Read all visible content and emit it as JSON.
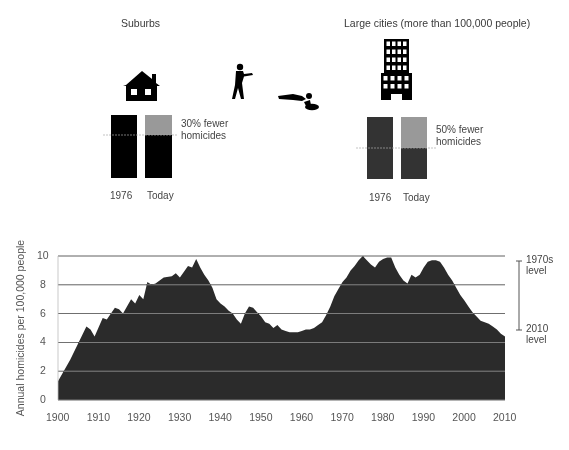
{
  "suburbs": {
    "title": "Suburbs",
    "icon": "house-icon",
    "bar_1976_label": "1976",
    "bar_today_label": "Today",
    "annotation_line1": "30% fewer",
    "annotation_line2": "homicides",
    "bar_color": "#000000",
    "reduction_color": "#999999",
    "reduction_pct": 30
  },
  "cities": {
    "title": "Large cities (more than 100,000 people)",
    "icon": "office-building-icon",
    "bar_1976_label": "1976",
    "bar_today_label": "Today",
    "annotation_line1": "50% fewer",
    "annotation_line2": "homicides",
    "bar_color": "#333333",
    "reduction_color": "#999999",
    "reduction_pct": 50
  },
  "pictograms": [
    "gunman-icon",
    "victim-lying-icon"
  ],
  "right_annotation": {
    "top_line1": "1970s",
    "top_line2": "level",
    "bottom_line1": "2010",
    "bottom_line2": "level"
  },
  "chart_data": {
    "type": "area",
    "title": "",
    "xlabel": "",
    "ylabel": "Annual homicides per 100,000 people",
    "xlim": [
      1900,
      2010
    ],
    "ylim": [
      0,
      10
    ],
    "grid": true,
    "fill_color": "#2b2b2b",
    "x_ticks": [
      "1900",
      "1910",
      "1920",
      "1930",
      "1940",
      "1950",
      "1960",
      "1970",
      "1980",
      "1990",
      "2000",
      "2010"
    ],
    "y_ticks": [
      "0",
      "2",
      "4",
      "6",
      "8",
      "10"
    ],
    "annotations": [
      "1970s level",
      "2010 level"
    ],
    "x": [
      1900,
      1903,
      1907,
      1908,
      1909,
      1911,
      1912,
      1914,
      1915,
      1916,
      1918,
      1919,
      1920,
      1921,
      1922,
      1923,
      1924,
      1926,
      1928,
      1929,
      1930,
      1932,
      1933,
      1934,
      1935,
      1936,
      1937,
      1938,
      1939,
      1940,
      1941,
      1942,
      1943,
      1944,
      1945,
      1946,
      1947,
      1948,
      1949,
      1950,
      1951,
      1952,
      1953,
      1954,
      1955,
      1956,
      1957,
      1958,
      1959,
      1960,
      1961,
      1962,
      1963,
      1964,
      1965,
      1966,
      1967,
      1968,
      1969,
      1970,
      1971,
      1972,
      1973,
      1974,
      1975,
      1976,
      1977,
      1978,
      1979,
      1980,
      1981,
      1982,
      1983,
      1984,
      1985,
      1986,
      1987,
      1988,
      1989,
      1990,
      1991,
      1992,
      1993,
      1994,
      1995,
      1996,
      1997,
      1998,
      1999,
      2000,
      2001,
      2002,
      2003,
      2004,
      2005,
      2006,
      2007,
      2008,
      2009,
      2010
    ],
    "values": [
      1.3,
      2.8,
      5.1,
      4.9,
      4.4,
      5.7,
      5.6,
      6.4,
      6.3,
      6.0,
      7.0,
      6.7,
      7.3,
      7.0,
      8.2,
      8.0,
      8.1,
      8.5,
      8.6,
      8.8,
      8.5,
      9.3,
      9.2,
      9.8,
      9.2,
      8.7,
      8.3,
      7.8,
      7.0,
      6.7,
      6.5,
      6.2,
      6.0,
      5.6,
      5.3,
      6.0,
      6.5,
      6.4,
      6.1,
      5.8,
      5.4,
      5.3,
      5.0,
      5.2,
      4.9,
      4.8,
      4.7,
      4.7,
      4.7,
      4.8,
      4.9,
      4.9,
      5.0,
      5.2,
      5.4,
      5.9,
      6.5,
      7.2,
      7.7,
      8.2,
      8.5,
      9.0,
      9.3,
      9.7,
      10.0,
      9.7,
      9.4,
      9.2,
      9.6,
      9.8,
      9.9,
      9.9,
      9.2,
      8.7,
      8.3,
      8.1,
      8.7,
      8.5,
      8.7,
      9.2,
      9.6,
      9.7,
      9.7,
      9.6,
      9.2,
      8.7,
      8.3,
      7.8,
      7.3,
      6.9,
      6.5,
      6.1,
      5.8,
      5.5,
      5.4,
      5.3,
      5.1,
      4.9,
      4.6,
      4.4
    ]
  }
}
